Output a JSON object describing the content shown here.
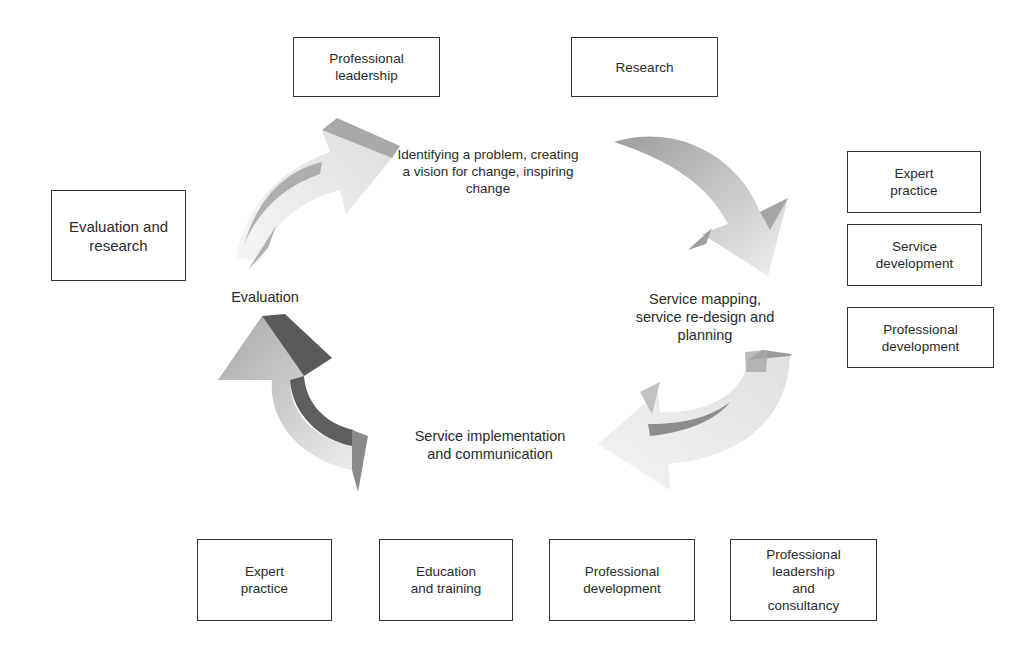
{
  "diagram": {
    "type": "cycle",
    "stages": [
      {
        "id": "stage-1",
        "label": "Identifying a problem, creating\na vision for change, inspiring\nchange"
      },
      {
        "id": "stage-2",
        "label": "Service mapping,\nservice re-design and\nplanning"
      },
      {
        "id": "stage-3",
        "label": "Service implementation\nand communication"
      },
      {
        "id": "stage-4",
        "label": "Evaluation"
      }
    ],
    "boxes": {
      "top": [
        {
          "label": "Professional\nleadership"
        },
        {
          "label": "Research"
        }
      ],
      "left": [
        {
          "label": "Evaluation and\nresearch"
        }
      ],
      "right": [
        {
          "label": "Expert\npractice"
        },
        {
          "label": "Service\ndevelopment"
        },
        {
          "label": "Professional\ndevelopment"
        }
      ],
      "bottom": [
        {
          "label": "Expert\npractice"
        },
        {
          "label": "Education\nand training"
        },
        {
          "label": "Professional\ndevelopment"
        },
        {
          "label": "Professional\nleadership\nand\nconsultancy"
        }
      ]
    },
    "arrows": [
      {
        "from": "stage-4",
        "to": "stage-1",
        "position": "upper-left",
        "direction": "clockwise"
      },
      {
        "from": "stage-1",
        "to": "stage-2",
        "position": "upper-right",
        "direction": "clockwise"
      },
      {
        "from": "stage-2",
        "to": "stage-3",
        "position": "lower-right",
        "direction": "clockwise"
      },
      {
        "from": "stage-3",
        "to": "stage-4",
        "position": "lower-left",
        "direction": "clockwise"
      }
    ],
    "colors": {
      "box_border": "#333333",
      "text": "#2a2a2a",
      "arrow_light": "#ececec",
      "arrow_mid": "#b5b5b5",
      "arrow_dark": "#6e6e6e"
    }
  }
}
